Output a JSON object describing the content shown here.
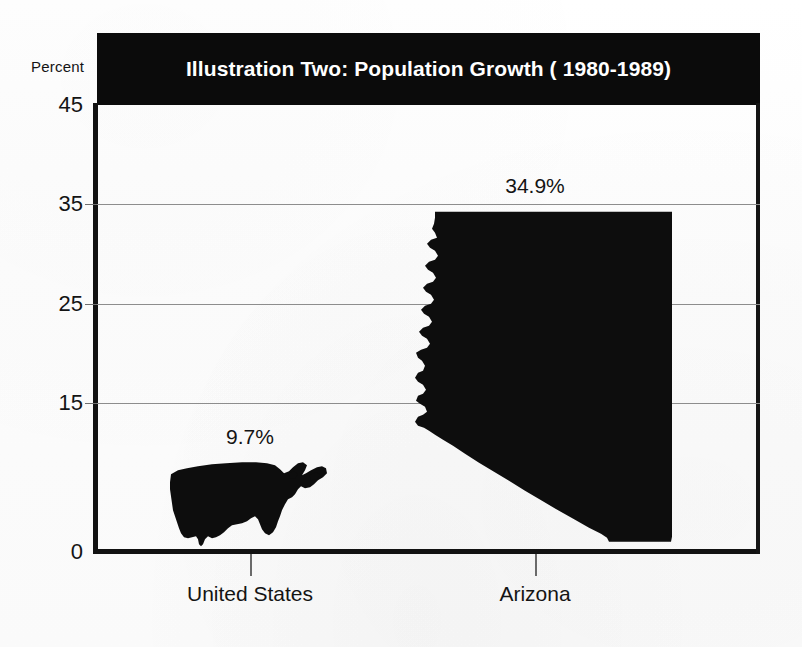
{
  "chart_data": {
    "type": "bar",
    "title": "Illustration Two: Population Growth ( 1980-1989)",
    "subtitle": "",
    "categories": [
      "United States",
      "Arizona"
    ],
    "values": [
      9.7,
      34.9
    ],
    "data_labels": [
      "9.7%",
      "34.9%"
    ],
    "xlabel": "",
    "ylabel": "Percent",
    "ylim": [
      0,
      45
    ],
    "yticks": [
      0,
      15,
      25,
      35,
      45
    ],
    "ytick_labels": [
      "0",
      "15",
      "25",
      "35",
      "45"
    ],
    "grid": true,
    "gridlines_at": [
      15,
      25,
      35
    ],
    "legend": "none",
    "marker_style": "map-silhouette",
    "series": [
      {
        "name": "Population Growth 1980-1989",
        "values": [
          9.7,
          34.9
        ]
      }
    ],
    "annotations": [
      {
        "text": "9.7%",
        "category": "United States",
        "value": 9.7
      },
      {
        "text": "34.9%",
        "category": "Arizona",
        "value": 34.9
      }
    ]
  },
  "chart": {
    "title": "Illustration Two: Population Growth ( 1980-1989)",
    "axis_label_y": "Percent",
    "y_ticks": [
      {
        "label": "45",
        "value": 45
      },
      {
        "label": "35",
        "value": 35
      },
      {
        "label": "25",
        "value": 25
      },
      {
        "label": "15",
        "value": 15
      },
      {
        "label": "0",
        "value": 0
      }
    ],
    "bars": [
      {
        "category": "United States",
        "value_label": "9.7%",
        "value": 9.7,
        "icon": "usa-map-silhouette"
      },
      {
        "category": "Arizona",
        "value_label": "34.9%",
        "value": 34.9,
        "icon": "arizona-map-silhouette"
      }
    ]
  },
  "colors": {
    "title_band": "#0b0b0b",
    "title_text": "#ffffff",
    "silhouette": "#0d0d0d",
    "axis": "#121212",
    "gridline": "#8d8d8d",
    "text": "#141414",
    "background": "#fdfdfd"
  }
}
